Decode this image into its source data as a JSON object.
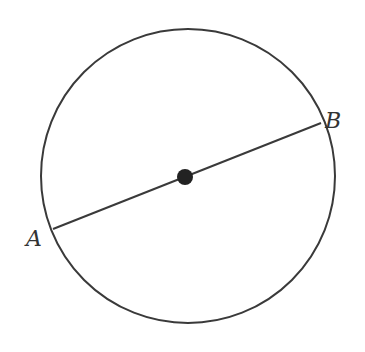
{
  "diagram": {
    "type": "circle-with-diameter",
    "circle": {
      "cx": 188,
      "cy": 176,
      "r": 147,
      "stroke": "#3a3a3a"
    },
    "center_point": {
      "x": 185,
      "y": 177,
      "r": 8,
      "fill": "#222222"
    },
    "segment": {
      "from": "A",
      "to": "B",
      "x1": 53,
      "y1": 229,
      "x2": 321,
      "y2": 123,
      "stroke": "#3a3a3a"
    },
    "points": [
      {
        "label": "A",
        "x": 26,
        "y": 228
      },
      {
        "label": "B",
        "x": 325,
        "y": 110
      }
    ]
  }
}
